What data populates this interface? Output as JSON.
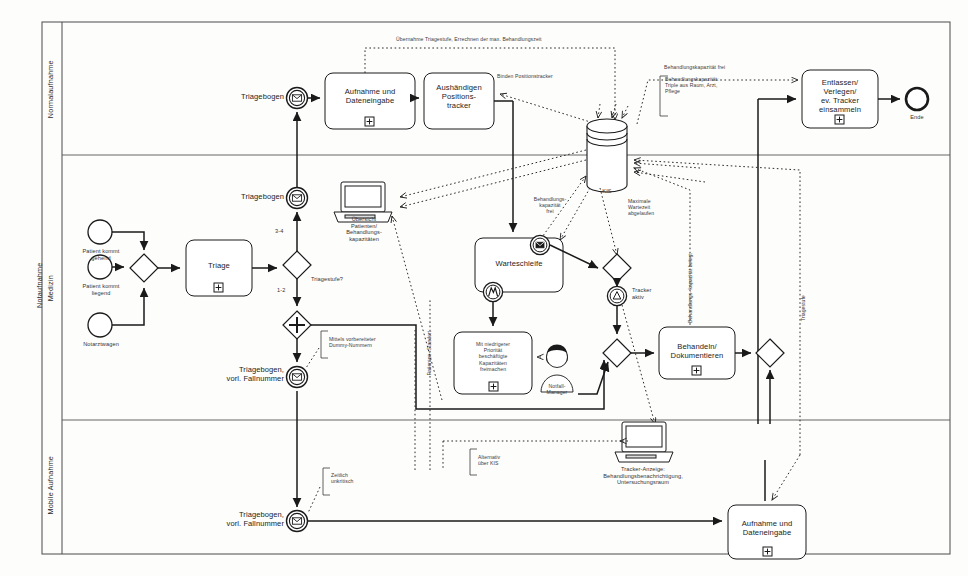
{
  "diagram": {
    "title": "Notaufnahme",
    "pool_label": "Notaufnahme",
    "lanes": [
      {
        "id": "normalaufnahme",
        "label": "Normalaufnahme"
      },
      {
        "id": "medizin",
        "label": "Medizin"
      },
      {
        "id": "mobile",
        "label": "Mobile Aufnahme"
      }
    ],
    "colors": {
      "stroke": "#1a1a1a",
      "lane_stroke": "#555555",
      "fill": "#ffffff",
      "dotted": "#2b2b2b",
      "background": "#fdfdfc"
    }
  },
  "events": {
    "start_gehend": "Patient kommt\ngehend",
    "start_liegend": "Patient kommt\nliegend",
    "start_notarztwagen": "Notarztwagen",
    "msg_triagebogen_top": "Triagebogen",
    "msg_triagebogen_mid": "Triagebogen",
    "msg_triagebogen_vorl": "Triagebogen,\nvorl. Fallnummer",
    "msg_triagebogen_vorl_mobile": "Triagebogen,\nvorl. Fallnummer",
    "tracker_aktiv": "Tracker\naktiv",
    "end": "Ende"
  },
  "tasks": {
    "aufnahme_dateneingabe": "Aufnahme und\nDateneingabe",
    "aushaendigen_tracker": "Aushändigen\nPositions-\ntracker",
    "entlassen_verlegen": "Entlassen/\nVerlegen/\nev. Tracker\neinsammeln",
    "triage": "Triage",
    "warteschleife": "Warteschleife",
    "kapazitaeten_freimachen": "Mit niedrigerer\nPriorität\nbeschäftigte\nKapazitäten\nfreimachen",
    "behandeln_dokumentieren": "Behandeln/\nDokumentieren",
    "aufnahme_dateneingabe_mobil": "Aufnahme und\nDateneingabe"
  },
  "gateways": {
    "start_merge": "X",
    "triagestufe": "Triagestufe?",
    "branch_34": "3-4",
    "branch_12": "1-2",
    "parallel_split": "+",
    "merge_behandeln": "X",
    "merge_after_behandeln": "X",
    "merge_bottom": "X"
  },
  "data_objects": {
    "kis": "KIS",
    "uebersicht_monitor": "Übersicht\nPatienten/\nBehandlungs-\nkapazitäten",
    "tracker_anzeige_monitor": "Tracker-Anzeige:\nBehandlungsbenachrichtigung,\nUntersuchungsraum"
  },
  "actors": {
    "notfall_manager": "Notfall-\nManager"
  },
  "annotations": {
    "uebernahme_triagestufe": "Übernahme Triagestufe, Errechnen der max. Behandlungszeit",
    "binden_positionstracker": "Binden Positionstracker",
    "behandlungskapazitaet_frei_top": "Behandlungskapazität frei",
    "behandlungskapazitaet_triple": "Behandlungskapazität:\nTriple aus Raum, Arzt,\nPflege",
    "behandlungskapazitaet_frei_mid": "Behandlungs-\nkapazität\nfrei",
    "maximale_wartezeit": "Maximale\nWartezeit\nabgelaufen",
    "behandlungskapazitaet_belegt": "Behandlungs-\nkapazität\nbelegt",
    "triagestufe_vertical": "Triagestufe",
    "patienten_standort": "Patienten-\nStandort",
    "dummy_nummern": "Mittels vorbereiteter\nDummy-Nummern",
    "zeitlich_unkritisch": "Zeitlich\nunkritisch",
    "alternativ_ueber_kis": "Alternativ\nüber KIS"
  }
}
